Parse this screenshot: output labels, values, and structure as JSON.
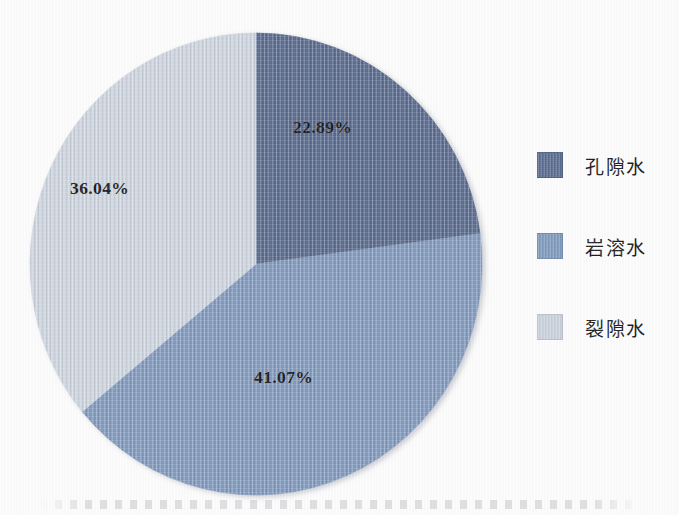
{
  "chart_data": {
    "type": "pie",
    "title": "",
    "subtitle": "",
    "xlabel": "",
    "ylabel": "",
    "legend_position": "right",
    "grid": false,
    "start_angle_deg": 0,
    "direction": "clockwise",
    "categories": [
      "孔隙水",
      "岩溶水",
      "裂隙水"
    ],
    "values": [
      22.89,
      41.07,
      36.04
    ],
    "value_labels": [
      "22.89%",
      "41.07%",
      "36.04%"
    ],
    "colors": [
      "#55688f",
      "#7e99c0",
      "#ced6e2"
    ],
    "slices": [
      {
        "label": "孔隙水",
        "value": 22.89,
        "value_label": "22.89%",
        "color": "#55688f"
      },
      {
        "label": "岩溶水",
        "value": 41.07,
        "value_label": "41.07%",
        "color": "#7e99c0"
      },
      {
        "label": "裂隙水",
        "value": 36.04,
        "value_label": "36.04%",
        "color": "#ced6e2"
      }
    ],
    "annotations": []
  },
  "legend": {
    "items": [
      {
        "label": "孔隙水",
        "color": "#55688f"
      },
      {
        "label": "岩溶水",
        "color": "#7e99c0"
      },
      {
        "label": "裂隙水",
        "color": "#ced6e2"
      }
    ]
  },
  "labels": {
    "pore": "22.89%",
    "karst": "41.07%",
    "fissure": "36.04%"
  },
  "colors": {
    "pore_water": "#55688f",
    "karst_water": "#7e99c0",
    "fissure_water": "#ced6e2",
    "background": "#ffffff",
    "text": "#16171b"
  }
}
